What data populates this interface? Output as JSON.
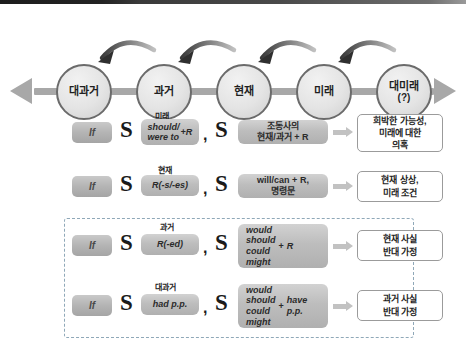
{
  "timeline": {
    "axis": {
      "left_arrow_icon": "arrow-left",
      "right_arrow_icon": "arrow-right"
    },
    "nodes": [
      {
        "label": "대과거",
        "sub": ""
      },
      {
        "label": "과거",
        "sub": ""
      },
      {
        "label": "현재",
        "sub": ""
      },
      {
        "label": "미래",
        "sub": ""
      },
      {
        "label": "대미래",
        "sub": "(?)"
      }
    ],
    "back_arrow_icon": "curved-arrow-left"
  },
  "rows": [
    {
      "if_label": "If",
      "subject1": "S",
      "tense_tag": "미래",
      "verb_top": "should/",
      "verb_bottom": "were to",
      "verb_suffix": "+R",
      "comma": ",",
      "subject2": "S",
      "main_line1": "조동사의",
      "main_line2": "현재/과거 + R",
      "arrow_icon": "arrow-right-small",
      "outcome_lines": [
        "희박한 가능성,",
        "미래에 대한",
        "의혹"
      ]
    },
    {
      "if_label": "If",
      "subject1": "S",
      "tense_tag": "현재",
      "verb_text": "R(-s/-es)",
      "comma": ",",
      "subject2": "S",
      "main_line1": "will/can + R,",
      "main_line2": "명령문",
      "arrow_icon": "arrow-right-small",
      "outcome_lines": [
        "현재 상상,",
        "미래 조건"
      ]
    },
    {
      "if_label": "If",
      "subject1": "S",
      "tense_tag": "과거",
      "verb_text": "R(-ed)",
      "comma": ",",
      "subject2": "S",
      "modals": [
        "would",
        "should",
        "could",
        "might"
      ],
      "plus": "+",
      "modal_right": [
        "R"
      ],
      "arrow_icon": "arrow-right-small",
      "outcome_lines": [
        "현재 사실",
        "반대 가정"
      ]
    },
    {
      "if_label": "If",
      "subject1": "S",
      "tense_tag": "대과거",
      "verb_text": "had p.p.",
      "comma": ",",
      "subject2": "S",
      "modals": [
        "would",
        "should",
        "could",
        "might"
      ],
      "plus": "+",
      "modal_right": [
        "have",
        "p.p."
      ],
      "arrow_icon": "arrow-right-small",
      "outcome_lines": [
        "과거 사실",
        "반대 가정"
      ]
    }
  ],
  "colors": {
    "node_border": "#6b6b6b",
    "axis": "#a8a8a8",
    "gray_box": "#bdbdbd",
    "dashed_border": "#8fa8b8",
    "outcome_border": "#9b9b9b"
  }
}
